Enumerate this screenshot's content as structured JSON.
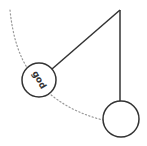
{
  "diagram": {
    "type": "pendulum",
    "colors": {
      "stroke": "#333333",
      "dotted_arc": "#999999",
      "background": "#ffffff"
    },
    "pivot": {
      "x": 120,
      "y": 10
    },
    "swung_bob": {
      "cx": 39,
      "cy": 80,
      "r": 17,
      "label": "god",
      "label_rotation_deg": 60
    },
    "rest_bob": {
      "cx": 121,
      "cy": 119,
      "r": 18,
      "label": ""
    },
    "arc_path": "dotted swing trajectory"
  }
}
